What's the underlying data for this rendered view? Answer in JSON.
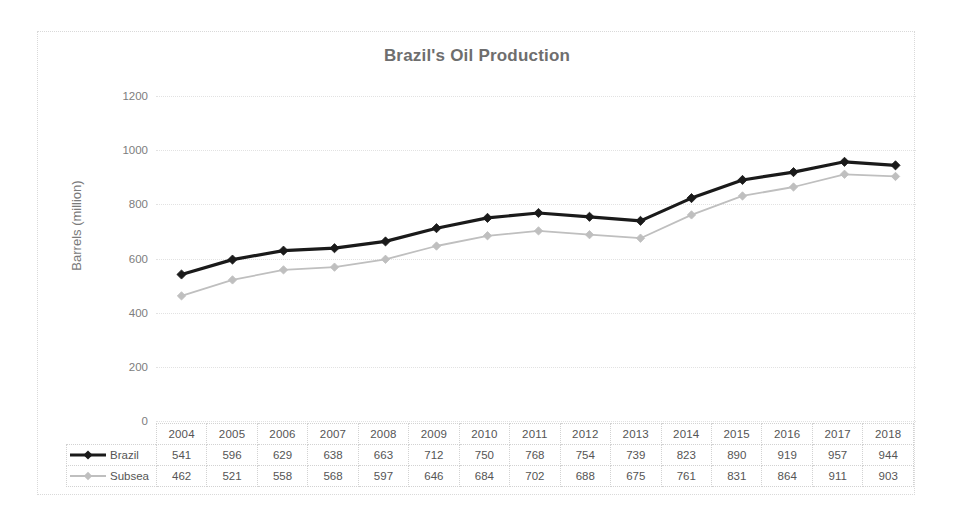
{
  "chart_data": {
    "type": "line",
    "title": "Brazil's Oil Production",
    "xlabel": "",
    "ylabel": "Barrels (million)",
    "categories": [
      "2004",
      "2005",
      "2006",
      "2007",
      "2008",
      "2009",
      "2010",
      "2011",
      "2012",
      "2013",
      "2014",
      "2015",
      "2016",
      "2017",
      "2018"
    ],
    "series": [
      {
        "name": "Brazil",
        "color": "#1a1a1a",
        "marker": "diamond",
        "values": [
          541,
          596,
          629,
          638,
          663,
          712,
          750,
          768,
          754,
          739,
          823,
          890,
          919,
          957,
          944
        ]
      },
      {
        "name": "Subsea",
        "color": "#bfbfbf",
        "marker": "diamond",
        "values": [
          462,
          521,
          558,
          568,
          597,
          646,
          684,
          702,
          688,
          675,
          761,
          831,
          864,
          911,
          903
        ]
      }
    ],
    "ylim": [
      0,
      1200
    ],
    "y_ticks": [
      "0",
      "200",
      "400",
      "600",
      "800",
      "1000",
      "1200"
    ],
    "grid": true,
    "legend_position": "data-table-left",
    "data_table_visible": true,
    "colors": {
      "title": "#6e6e6e",
      "gridline": "#e2e2e2",
      "border": "#d9d9d9",
      "text": "#555555",
      "background": "#ffffff"
    }
  }
}
